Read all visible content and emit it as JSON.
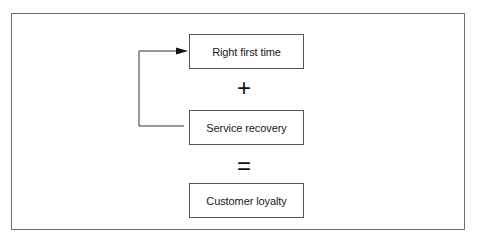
{
  "diagram": {
    "boxes": [
      {
        "label": "Right first time"
      },
      {
        "label": "Service recovery"
      },
      {
        "label": "Customer loyalty"
      }
    ],
    "operators": {
      "plus": "+",
      "equals": "="
    },
    "connector": {
      "from": "Service recovery",
      "to": "Right first time",
      "icon": "arrow-right-icon"
    },
    "colors": {
      "line": "#555555",
      "frame": "#6e6e6e",
      "text": "#1a1a1a",
      "background": "#ffffff"
    }
  }
}
